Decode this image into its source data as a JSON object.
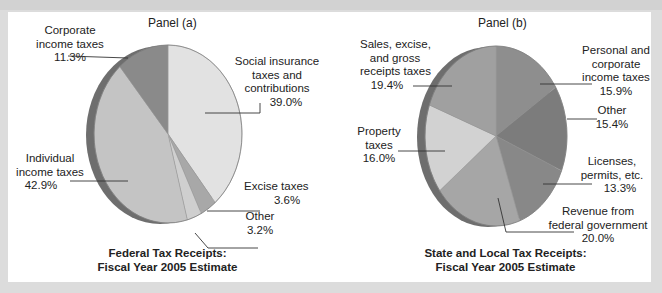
{
  "colors": {
    "background": "#dcdcdc",
    "panel": "#ffffff",
    "text": "#222222"
  },
  "chart_data": [
    {
      "type": "pie",
      "panel": "Panel (a)",
      "title": "Federal Tax Receipts: Fiscal Year 2005 Estimate",
      "title_lines": [
        "Federal Tax Receipts:",
        "Fiscal Year 2005 Estimate"
      ],
      "categories": [
        "Social insurance taxes and contributions",
        "Excise taxes",
        "Other",
        "Individual income taxes",
        "Corporate income taxes"
      ],
      "values": [
        39.0,
        3.6,
        3.2,
        42.9,
        11.3
      ],
      "unit": "%",
      "slice_colors": [
        "#e2e2e2",
        "#a8a8a8",
        "#cfcfcf",
        "#c4c4c4",
        "#8a8a8a"
      ],
      "labels": [
        {
          "lines": [
            "Social insurance",
            "taxes and",
            "contributions"
          ],
          "value": "39.0%"
        },
        {
          "lines": [
            "Excise taxes"
          ],
          "value": "3.6%"
        },
        {
          "lines": [
            "Other"
          ],
          "value": "3.2%"
        },
        {
          "lines": [
            "Individual",
            "income taxes"
          ],
          "value": "42.9%"
        },
        {
          "lines": [
            "Corporate",
            "income taxes"
          ],
          "value": "11.3%"
        }
      ]
    },
    {
      "type": "pie",
      "panel": "Panel (b)",
      "title": "State and Local Tax Receipts: Fiscal Year 2005 Estimate",
      "title_lines": [
        "State and Local Tax Receipts:",
        "Fiscal Year 2005 Estimate"
      ],
      "categories": [
        "Personal and corporate income taxes",
        "Other",
        "Licenses, permits, etc.",
        "Revenue from federal government",
        "Property taxes",
        "Sales, excise, and gross receipts taxes"
      ],
      "values": [
        15.9,
        15.4,
        13.3,
        20.0,
        16.0,
        19.4
      ],
      "unit": "%",
      "slice_colors": [
        "#8e8e8e",
        "#7c7c7c",
        "#888888",
        "#a6a6a6",
        "#d2d2d2",
        "#a0a0a0"
      ],
      "labels": [
        {
          "lines": [
            "Personal and",
            "corporate",
            "income taxes"
          ],
          "value": "15.9%"
        },
        {
          "lines": [
            "Other"
          ],
          "value": "15.4%"
        },
        {
          "lines": [
            "Licenses,",
            "permits, etc."
          ],
          "value": "13.3%"
        },
        {
          "lines": [
            "Revenue from",
            "federal government"
          ],
          "value": "20.0%"
        },
        {
          "lines": [
            "Property",
            "taxes"
          ],
          "value": "16.0%"
        },
        {
          "lines": [
            "Sales, excise,",
            "and gross",
            "receipts taxes"
          ],
          "value": "19.4%"
        }
      ]
    }
  ],
  "panel_a": {
    "title": "Panel (a)",
    "social": {
      "l1": "Social insurance",
      "l2": "taxes and",
      "l3": "contributions",
      "v": "39.0%"
    },
    "excise": {
      "l1": "Excise taxes",
      "v": "3.6%"
    },
    "other": {
      "l1": "Other",
      "v": "3.2%"
    },
    "individual": {
      "l1": "Individual",
      "l2": "income taxes",
      "v": "42.9%"
    },
    "corporate": {
      "l1": "Corporate",
      "l2": "income taxes",
      "v": "11.3%"
    },
    "caption": {
      "l1": "Federal Tax Receipts:",
      "l2": "Fiscal Year 2005 Estimate"
    }
  },
  "panel_b": {
    "title": "Panel (b)",
    "personal": {
      "l1": "Personal and",
      "l2": "corporate",
      "l3": "income taxes",
      "v": "15.9%"
    },
    "other": {
      "l1": "Other",
      "v": "15.4%"
    },
    "licenses": {
      "l1": "Licenses,",
      "l2": "permits, etc.",
      "v": "13.3%"
    },
    "federal": {
      "l1": "Revenue from",
      "l2": "federal government",
      "v": "20.0%"
    },
    "property": {
      "l1": "Property",
      "l2": "taxes",
      "v": "16.0%"
    },
    "sales": {
      "l1": "Sales, excise,",
      "l2": "and gross",
      "l3": "receipts taxes",
      "v": "19.4%"
    },
    "caption": {
      "l1": "State and Local Tax Receipts:",
      "l2": "Fiscal Year 2005 Estimate"
    }
  }
}
